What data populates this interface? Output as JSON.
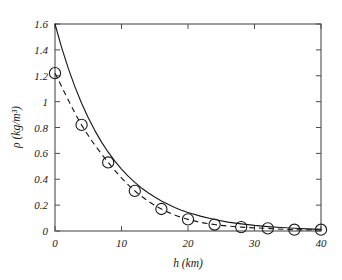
{
  "chart_data": {
    "type": "scatter",
    "title": "",
    "xlabel": "h (km)",
    "ylabel": "ρ (kg/m³)",
    "xlim": [
      0,
      40
    ],
    "ylim": [
      0,
      1.6
    ],
    "xticks": [
      0,
      10,
      20,
      30,
      40
    ],
    "xtick_labels": [
      "0",
      "10",
      "20",
      "30",
      "40"
    ],
    "yticks": [
      0,
      0.2,
      0.4,
      0.6,
      0.8,
      1,
      1.2,
      1.4,
      1.6
    ],
    "ytick_labels": [
      "0",
      "0.2",
      "0.4",
      "0.6",
      "0.8",
      "1",
      "1.2",
      "1.4",
      "1.6"
    ],
    "grid": false,
    "legend": null,
    "series": [
      {
        "name": "data-markers",
        "style": "circle-markers",
        "marker": "open-circle",
        "color": "#1a1a1a",
        "x": [
          0,
          4,
          8,
          12,
          16,
          20,
          24,
          28,
          32,
          36,
          40
        ],
        "values": [
          1.22,
          0.82,
          0.53,
          0.31,
          0.17,
          0.09,
          0.05,
          0.03,
          0.02,
          0.01,
          0.01
        ]
      },
      {
        "name": "exponential-fit-solid",
        "style": "solid-line",
        "color": "#1a1a1a",
        "x": [
          0,
          1,
          2,
          3,
          4,
          5,
          6,
          7,
          8,
          9,
          10,
          11,
          12,
          13,
          14,
          15,
          16,
          17,
          18,
          19,
          20,
          22,
          24,
          26,
          28,
          30,
          32,
          34,
          36,
          38,
          40
        ],
        "values": [
          1.6,
          1.418,
          1.257,
          1.114,
          0.987,
          0.875,
          0.776,
          0.687,
          0.609,
          0.54,
          0.479,
          0.424,
          0.376,
          0.333,
          0.295,
          0.262,
          0.232,
          0.206,
          0.182,
          0.161,
          0.143,
          0.113,
          0.089,
          0.069,
          0.055,
          0.043,
          0.034,
          0.027,
          0.021,
          0.016,
          0.013
        ]
      },
      {
        "name": "interpolation-dashed",
        "style": "dashed-line",
        "color": "#1a1a1a",
        "x": [
          0,
          4,
          8,
          12,
          16,
          20,
          24,
          28,
          32,
          36,
          40
        ],
        "values": [
          1.22,
          0.82,
          0.53,
          0.31,
          0.17,
          0.09,
          0.05,
          0.03,
          0.02,
          0.01,
          0.01
        ]
      }
    ],
    "annotations": []
  },
  "figure": {
    "axis_color": "#4d4d4d",
    "ink_color": "#1a1a1a",
    "background": "#ffffff"
  }
}
